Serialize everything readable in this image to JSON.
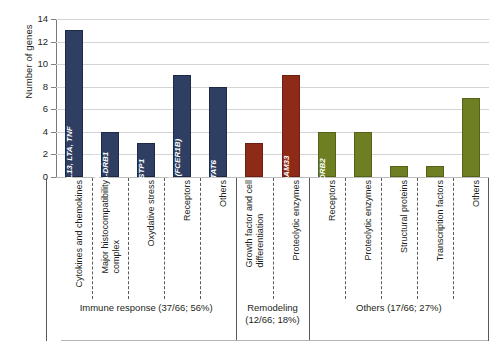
{
  "chart_data": {
    "type": "bar",
    "title": "",
    "xlabel": "",
    "ylabel": "Number of genes",
    "ylim": [
      0,
      14
    ],
    "ytick_values": [
      0,
      2,
      4,
      6,
      8,
      10,
      12,
      14
    ],
    "ytick_labels": [
      "0",
      "2",
      "4",
      "6",
      "8",
      "10",
      "12",
      "14"
    ],
    "grid": true,
    "legend": "none",
    "categories": [
      "Cytokines and chemokines",
      "Major histocompatibility complex",
      "Oxydative stress",
      "Receptors",
      "Others",
      "Growth factor and cell differentiation",
      "Proteolytic enzymes",
      "Receptors",
      "Proteolytic enzymes",
      "Structural proteins",
      "Transcription factors",
      "Others"
    ],
    "values": [
      13,
      4,
      3,
      9,
      8,
      3,
      9,
      4,
      4,
      1,
      1,
      7
    ],
    "bar_colors": [
      "#2e3f63",
      "#2e3f63",
      "#2e3f63",
      "#2e3f63",
      "#2e3f63",
      "#8e2b18",
      "#8e2b18",
      "#6d7f22",
      "#6d7f22",
      "#6d7f22",
      "#6d7f22",
      "#6d7f22"
    ],
    "bar_annotations": [
      "IL4, IL10, IL13, LTA, TNF",
      "HLA-DQB1\nHLA-DRB1",
      "GSTP1",
      "CD14, IL4R,\nMS4A2 (FCER1B)",
      "STAT6",
      "",
      "ADAM33",
      "ADRB2",
      "",
      "",
      "",
      ""
    ],
    "groups": [
      {
        "label": "Immune response (37/66; 56%)",
        "count": 37,
        "total": 66,
        "percent": 56,
        "categories": 5
      },
      {
        "label": "Remodeling\n(12/66; 18%)",
        "count": 12,
        "total": 66,
        "percent": 18,
        "categories": 2
      },
      {
        "label": "Others (17/66; 27%)",
        "count": 17,
        "total": 66,
        "percent": 27,
        "categories": 5
      }
    ],
    "colors": {
      "blue": "#2e3f63",
      "red": "#8e2b18",
      "green": "#6d7f22",
      "grid": "#d4d4d4",
      "axis": "#595959"
    }
  },
  "axis": {
    "y_title": "Number of genes",
    "ticks": [
      "0",
      "2",
      "4",
      "6",
      "8",
      "10",
      "12",
      "14"
    ]
  },
  "bars": [
    {
      "value": "13",
      "annotation_line1": "IL4, IL10, IL13, LTA, TNF",
      "annotation_line2": ""
    },
    {
      "value": "4",
      "annotation_line1": "HLA-DQB1",
      "annotation_line2": "HLA-DRB1"
    },
    {
      "value": "3",
      "annotation_line1": "GSTP1",
      "annotation_line2": ""
    },
    {
      "value": "9",
      "annotation_line1": "CD14, IL4R,",
      "annotation_line2": "MS4A2 (FCER1B)"
    },
    {
      "value": "8",
      "annotation_line1": "STAT6",
      "annotation_line2": ""
    },
    {
      "value": "3",
      "annotation_line1": "",
      "annotation_line2": ""
    },
    {
      "value": "9",
      "annotation_line1": "ADAM33",
      "annotation_line2": ""
    },
    {
      "value": "4",
      "annotation_line1": "ADRB2",
      "annotation_line2": ""
    },
    {
      "value": "4",
      "annotation_line1": "",
      "annotation_line2": ""
    },
    {
      "value": "1",
      "annotation_line1": "",
      "annotation_line2": ""
    },
    {
      "value": "1",
      "annotation_line1": "",
      "annotation_line2": ""
    },
    {
      "value": "7",
      "annotation_line1": "",
      "annotation_line2": ""
    }
  ],
  "categories": [
    {
      "line1": "Cytokines and chemokines",
      "line2": ""
    },
    {
      "line1": "Major histocompatibility",
      "line2": "complex"
    },
    {
      "line1": "Oxydative stress",
      "line2": ""
    },
    {
      "line1": "Receptors",
      "line2": ""
    },
    {
      "line1": "Others",
      "line2": ""
    },
    {
      "line1": "Growth factor and cell",
      "line2": "differentiation"
    },
    {
      "line1": "Proteolytic enzymes",
      "line2": ""
    },
    {
      "line1": "Receptors",
      "line2": ""
    },
    {
      "line1": "Proteolytic enzymes",
      "line2": ""
    },
    {
      "line1": "Structural proteins",
      "line2": ""
    },
    {
      "line1": "Transcription factors",
      "line2": ""
    },
    {
      "line1": "Others",
      "line2": ""
    }
  ],
  "groups": [
    {
      "line1": "Immune response (37/66; 56%)",
      "line2": ""
    },
    {
      "line1": "Remodeling",
      "line2": "(12/66; 18%)"
    },
    {
      "line1": "Others (17/66; 27%)",
      "line2": ""
    }
  ]
}
